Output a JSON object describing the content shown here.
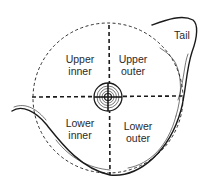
{
  "diagram": {
    "colors": {
      "line": "#1a1a1a",
      "text": "#2a2a2a",
      "background": "#ffffff"
    },
    "labels": {
      "upper_inner": {
        "line1": "Upper",
        "line2": "inner"
      },
      "upper_outer": {
        "line1": "Upper",
        "line2": "outer"
      },
      "lower_inner": {
        "line1": "Lower",
        "line2": "inner"
      },
      "lower_outer": {
        "line1": "Lower",
        "line2": "outer"
      },
      "tail": "Tail"
    },
    "elements": [
      "dashed-circle-boundary",
      "vertical-dashed-axis",
      "horizontal-dashed-axis",
      "nipple-areola",
      "breast-outline",
      "axillary-tail"
    ]
  }
}
